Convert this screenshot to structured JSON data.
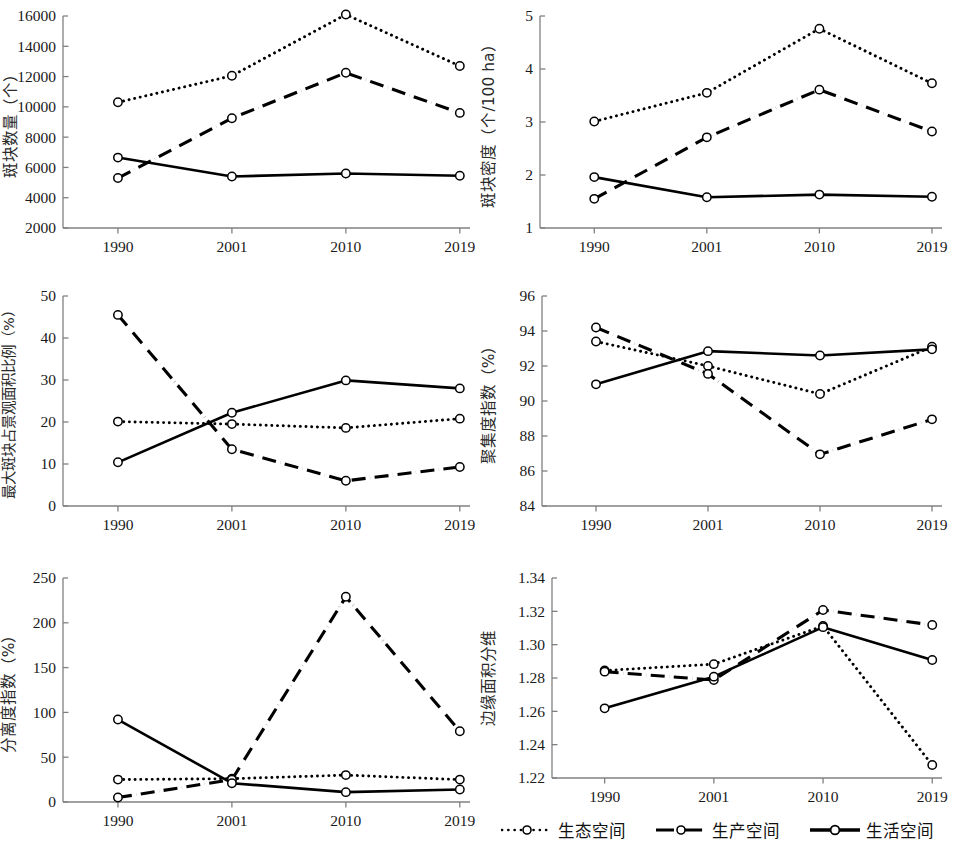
{
  "figure": {
    "axis_color": "#808080",
    "series_color": "#000000",
    "categories": [
      "1990",
      "2001",
      "2010",
      "2019"
    ],
    "legend": {
      "position": "bottom-right",
      "items": [
        {
          "label": "生态空间",
          "style": "dotted",
          "marker": "open-circle"
        },
        {
          "label": "生产空间",
          "style": "dash-dot",
          "marker": "open-circle"
        },
        {
          "label": "生活空间",
          "style": "solid",
          "marker": "open-circle"
        }
      ]
    }
  },
  "chart_data": [
    {
      "type": "line",
      "panel": "top-left",
      "title": "",
      "xlabel": "",
      "ylabel": "斑块数量（个）",
      "categories": [
        "1990",
        "2001",
        "2010",
        "2019"
      ],
      "ylim": [
        2000,
        16000
      ],
      "yticks": [
        2000,
        4000,
        6000,
        8000,
        10000,
        12000,
        14000,
        16000
      ],
      "ytick_labels": [
        "2000",
        "4000",
        "6000",
        "8000",
        "10000",
        "12000",
        "14000",
        "16000"
      ],
      "grid": false,
      "series": [
        {
          "name": "生态空间",
          "style": "dotted",
          "values": [
            10300,
            12050,
            16100,
            12700
          ]
        },
        {
          "name": "生产空间",
          "style": "dash-dot",
          "values": [
            5300,
            9250,
            12250,
            9600
          ]
        },
        {
          "name": "生活空间",
          "style": "solid",
          "values": [
            6650,
            5400,
            5600,
            5450
          ]
        }
      ]
    },
    {
      "type": "line",
      "panel": "top-right",
      "title": "",
      "xlabel": "",
      "ylabel": "斑块密度（个/100 ha）",
      "categories": [
        "1990",
        "2001",
        "2010",
        "2019"
      ],
      "ylim": [
        1,
        5
      ],
      "yticks": [
        1,
        2,
        3,
        4,
        5
      ],
      "ytick_labels": [
        "1",
        "2",
        "3",
        "4",
        "5"
      ],
      "grid": false,
      "series": [
        {
          "name": "生态空间",
          "style": "dotted",
          "values": [
            3.01,
            3.55,
            4.76,
            3.73
          ]
        },
        {
          "name": "生产空间",
          "style": "dash-dot",
          "values": [
            1.55,
            2.71,
            3.61,
            2.82
          ]
        },
        {
          "name": "生活空间",
          "style": "solid",
          "values": [
            1.96,
            1.58,
            1.63,
            1.59
          ]
        }
      ]
    },
    {
      "type": "line",
      "panel": "middle-left",
      "title": "",
      "xlabel": "",
      "ylabel": "最大斑块占景观面积比例（%）",
      "categories": [
        "1990",
        "2001",
        "2010",
        "2019"
      ],
      "ylim": [
        0,
        50
      ],
      "yticks": [
        0,
        10,
        20,
        30,
        40,
        50
      ],
      "ytick_labels": [
        "0",
        "10",
        "20",
        "30",
        "40",
        "50"
      ],
      "grid": false,
      "series": [
        {
          "name": "生态空间",
          "style": "dotted",
          "values": [
            20.1,
            19.5,
            18.6,
            20.8
          ]
        },
        {
          "name": "生产空间",
          "style": "dash-dot",
          "values": [
            45.5,
            13.5,
            6.0,
            9.3
          ]
        },
        {
          "name": "生活空间",
          "style": "solid",
          "values": [
            10.4,
            22.2,
            29.9,
            28.0
          ]
        }
      ]
    },
    {
      "type": "line",
      "panel": "middle-right",
      "title": "",
      "xlabel": "",
      "ylabel": "聚集度指数（%）",
      "categories": [
        "1990",
        "2001",
        "2010",
        "2019"
      ],
      "ylim": [
        84,
        96
      ],
      "yticks": [
        84,
        86,
        88,
        90,
        92,
        94,
        96
      ],
      "ytick_labels": [
        "84",
        "86",
        "88",
        "90",
        "92",
        "94",
        "96"
      ],
      "grid": false,
      "series": [
        {
          "name": "生态空间",
          "style": "dotted",
          "values": [
            93.4,
            92.0,
            90.4,
            93.1
          ]
        },
        {
          "name": "生产空间",
          "style": "dash-dot",
          "values": [
            94.2,
            91.55,
            86.95,
            88.95
          ]
        },
        {
          "name": "生活空间",
          "style": "solid",
          "values": [
            90.95,
            92.85,
            92.6,
            92.95
          ]
        }
      ]
    },
    {
      "type": "line",
      "panel": "bottom-left",
      "title": "",
      "xlabel": "",
      "ylabel": "分离度指数（%）",
      "categories": [
        "1990",
        "2001",
        "2010",
        "2019"
      ],
      "ylim": [
        0,
        250
      ],
      "yticks": [
        0,
        50,
        100,
        150,
        200,
        250
      ],
      "ytick_labels": [
        "0",
        "50",
        "100",
        "150",
        "200",
        "250"
      ],
      "grid": false,
      "series": [
        {
          "name": "生态空间",
          "style": "dotted",
          "values": [
            25,
            26,
            30,
            25
          ]
        },
        {
          "name": "生产空间",
          "style": "dash-dot",
          "values": [
            5,
            25,
            229,
            79
          ]
        },
        {
          "name": "生活空间",
          "style": "solid",
          "values": [
            92,
            21,
            11,
            14
          ]
        }
      ]
    },
    {
      "type": "line",
      "panel": "bottom-right",
      "title": "",
      "xlabel": "",
      "ylabel": "边缘面积分维",
      "categories": [
        "1990",
        "2001",
        "2010",
        "2019"
      ],
      "ylim": [
        1.22,
        1.34
      ],
      "yticks": [
        1.22,
        1.24,
        1.26,
        1.28,
        1.3,
        1.32,
        1.34
      ],
      "ytick_labels": [
        "1.22",
        "1.24",
        "1.26",
        "1.28",
        "1.30",
        "1.32",
        "1.34"
      ],
      "grid": false,
      "series": [
        {
          "name": "生态空间",
          "style": "dotted",
          "values": [
            1.2845,
            1.2883,
            1.3112,
            1.2278
          ]
        },
        {
          "name": "生产空间",
          "style": "dash-dot",
          "values": [
            1.2838,
            1.2788,
            1.3208,
            1.3118
          ]
        },
        {
          "name": "生活空间",
          "style": "solid",
          "values": [
            1.2618,
            1.2808,
            1.3105,
            1.2908
          ]
        }
      ]
    }
  ]
}
